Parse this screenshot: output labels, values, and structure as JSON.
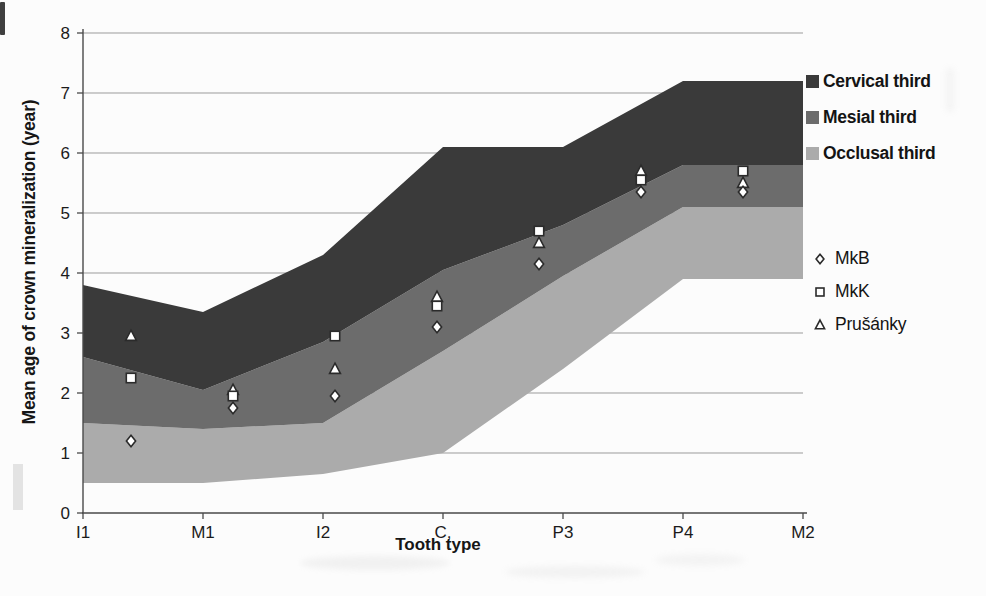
{
  "figure": {
    "background": "#fcfcfc"
  },
  "chart_data": {
    "type": "area+scatter",
    "title": "",
    "xlabel": "Tooth type",
    "ylabel": "Mean age of crown mineralization (year)",
    "categories": [
      "I1",
      "M1",
      "I2",
      "C,",
      "P3",
      "P4",
      "M2"
    ],
    "ylim": [
      0,
      8
    ],
    "yticks": [
      0,
      1,
      2,
      3,
      4,
      5,
      6,
      7,
      8
    ],
    "grid": "horizontal",
    "legend_position": "right",
    "colors": {
      "grid": "#9b9b9b",
      "axis": "#4a4a4a",
      "tick_text": "#1b1b1b",
      "marker_fill": "#ffffff",
      "marker_stroke": "#2b2b2b"
    },
    "bands": [
      {
        "name": "Occlusal third",
        "color": "#ababab",
        "lower": [
          0.5,
          0.5,
          0.65,
          1.0,
          2.4,
          3.9,
          3.9
        ],
        "upper": [
          1.5,
          1.4,
          1.5,
          2.7,
          3.95,
          5.1,
          5.1
        ]
      },
      {
        "name": "Mesial third",
        "color": "#6c6c6c",
        "lower": [
          1.5,
          1.4,
          1.5,
          2.7,
          3.95,
          5.1,
          5.1
        ],
        "upper": [
          2.6,
          2.05,
          2.85,
          4.05,
          4.8,
          5.8,
          5.8
        ]
      },
      {
        "name": "Cervical third",
        "color": "#3a3a3a",
        "lower": [
          2.6,
          2.05,
          2.85,
          4.05,
          4.8,
          5.8,
          5.8
        ],
        "upper": [
          3.8,
          3.35,
          4.3,
          6.1,
          6.1,
          7.2,
          7.2
        ]
      }
    ],
    "series": [
      {
        "name": "MkB",
        "marker": "diamond",
        "values": [
          1.2,
          1.75,
          1.95,
          3.1,
          4.15,
          5.35,
          5.35
        ]
      },
      {
        "name": "MkK",
        "marker": "square",
        "values": [
          2.25,
          1.95,
          2.95,
          3.45,
          4.7,
          5.55,
          5.7
        ]
      },
      {
        "name": "Prušánky",
        "marker": "triangle",
        "values": [
          2.95,
          2.05,
          2.4,
          3.6,
          4.5,
          5.7,
          5.5
        ]
      }
    ]
  }
}
